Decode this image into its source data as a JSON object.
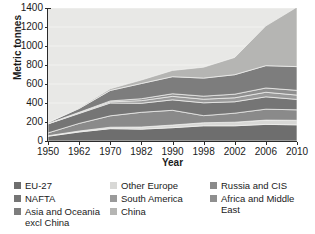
{
  "chart_data": {
    "type": "area",
    "stacked": true,
    "title": "",
    "xlabel": "Year",
    "ylabel": "Metric tonnes",
    "x": [
      1950,
      1962,
      1970,
      1982,
      1990,
      1998,
      2002,
      2006,
      2010
    ],
    "categories": [
      "1950",
      "1962",
      "1970",
      "1982",
      "1990",
      "1998",
      "2002",
      "2006",
      "2010"
    ],
    "xlim": [
      1950,
      2010
    ],
    "ylim": [
      0,
      1400
    ],
    "yticks": [
      0,
      200,
      400,
      600,
      800,
      1000,
      1200,
      1400
    ],
    "grid": true,
    "grid_axis": "y",
    "legend_position": "bottom",
    "series": [
      {
        "name": "EU-27",
        "color": "#6e6e6e",
        "values": [
          50,
          95,
          130,
          125,
          140,
          160,
          160,
          175,
          170
        ]
      },
      {
        "name": "Other Europe",
        "color": "#d8d8d6",
        "values": [
          5,
          10,
          15,
          22,
          28,
          32,
          38,
          45,
          48
        ]
      },
      {
        "name": "Russia and CIS",
        "color": "#8a8a8a",
        "values": [
          30,
          80,
          120,
          155,
          155,
          75,
          95,
          115,
          110
        ]
      },
      {
        "name": "NAFTA",
        "color": "#757575",
        "values": [
          95,
          105,
          135,
          95,
          110,
          135,
          120,
          130,
          110
        ]
      },
      {
        "name": "South America",
        "color": "#9a9a9a",
        "values": [
          2,
          6,
          12,
          28,
          37,
          38,
          42,
          48,
          45
        ]
      },
      {
        "name": "Africa and Middle East",
        "color": "#8f8f8f",
        "values": [
          2,
          6,
          10,
          20,
          27,
          32,
          38,
          45,
          50
        ]
      },
      {
        "name": "Asia and Oceania excl China",
        "color": "#7d7d7d",
        "values": [
          10,
          40,
          110,
          160,
          180,
          190,
          205,
          235,
          250
        ]
      },
      {
        "name": "China",
        "color": "#b5b5b3",
        "values": [
          1,
          8,
          18,
          37,
          66,
          115,
          182,
          419,
          627
        ]
      }
    ],
    "totals": [
      195,
      350,
      550,
      642,
      743,
      777,
      880,
      1212,
      1410
    ]
  },
  "axis": {
    "y_ticks": [
      "1400",
      "1200",
      "1000",
      "800",
      "600",
      "400",
      "200",
      "0"
    ],
    "x_ticks": [
      "1950",
      "1962",
      "1970",
      "1982",
      "1990",
      "1998",
      "2002",
      "2006",
      "2010"
    ],
    "y_title": "Metric tonnes",
    "x_title": "Year"
  },
  "legend": {
    "columns": [
      {
        "items": [
          {
            "label": "EU-27",
            "color": "#6e6e6e"
          },
          {
            "label": "NAFTA",
            "color": "#757575"
          },
          {
            "label": "Asia and Oceania excl China",
            "color": "#7d7d7d"
          }
        ]
      },
      {
        "items": [
          {
            "label": "Other Europe",
            "color": "#d8d8d6"
          },
          {
            "label": "South America",
            "color": "#9a9a9a"
          },
          {
            "label": "China",
            "color": "#b5b5b3"
          }
        ]
      },
      {
        "items": [
          {
            "label": "Russia and CIS",
            "color": "#8a8a8a"
          },
          {
            "label": "Africa and Middle East",
            "color": "#8f8f8f"
          }
        ]
      }
    ]
  }
}
